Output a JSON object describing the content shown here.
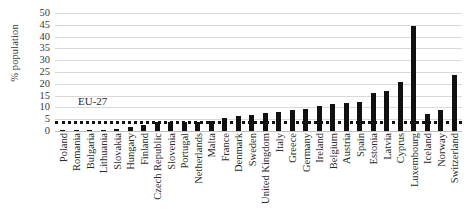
{
  "chart_data": {
    "type": "bar",
    "title": "",
    "xlabel": "",
    "ylabel": "% population",
    "ylim": [
      0,
      50
    ],
    "ytick_step": 5,
    "yticks": [
      50,
      45,
      40,
      35,
      30,
      25,
      20,
      15,
      10,
      5,
      0
    ],
    "grid": true,
    "legend": "none",
    "bar_color": "#111111",
    "categories": [
      "Poland",
      "Romania",
      "Bulgaria",
      "Lithuania",
      "Slovakia",
      "Hungary",
      "Finland",
      "Czech Republic",
      "Slovenia",
      "Portugal",
      "Netherlands",
      "Malta",
      "France",
      "Denmark",
      "Sweden",
      "United Kingdom",
      "Italy",
      "Greece",
      "Germany",
      "Ireland",
      "Belgium",
      "Austria",
      "Spain",
      "Estonia",
      "Latvia",
      "Cyprus",
      "Luxembourg",
      "Iceland",
      "Norway",
      "Switzerland"
    ],
    "values": [
      0.1,
      0.1,
      0.4,
      0.4,
      0.9,
      1.7,
      2.7,
      3.8,
      3.9,
      3.9,
      3.9,
      4.3,
      5.5,
      6.3,
      6.9,
      7.8,
      8.0,
      8.9,
      9.4,
      10.8,
      11.3,
      11.7,
      12.5,
      16.2,
      16.9,
      20.6,
      44.5,
      7.2,
      8.9,
      23.6
    ],
    "annotations": [
      {
        "name": "eu-27-reference-line",
        "label": "EU-27",
        "value": 4.3,
        "style": "dotted-horizontal",
        "color": "#111111"
      }
    ]
  }
}
